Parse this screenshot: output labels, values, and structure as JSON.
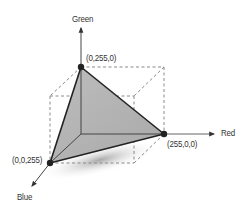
{
  "diagram": {
    "axes": {
      "green": {
        "label": "Green"
      },
      "red": {
        "label": "Red"
      },
      "blue": {
        "label": "Blue"
      }
    },
    "vertices": {
      "green": {
        "label": "(0,255,0)"
      },
      "red": {
        "label": "(255,0,0)"
      },
      "blue": {
        "label": "(0,0,255)"
      }
    },
    "colors": {
      "face_fill": "#b8b8b8",
      "edge": "#222222",
      "dashed": "#8a8a8a",
      "axis": "#555555",
      "vertex_dot": "#222222"
    }
  }
}
